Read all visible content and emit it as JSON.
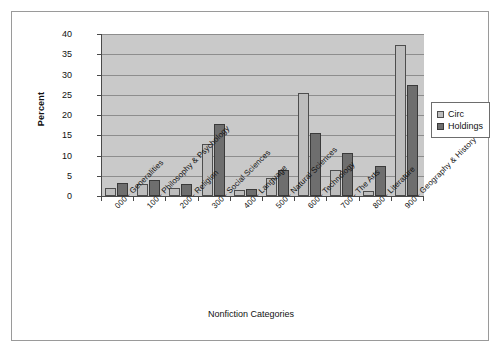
{
  "chart_data": {
    "type": "bar",
    "title": "",
    "xlabel": "Nonfiction Categories",
    "ylabel": "Percent",
    "ylim": [
      0,
      40
    ],
    "yticks": [
      0,
      5,
      10,
      15,
      20,
      25,
      30,
      35,
      40
    ],
    "grid": true,
    "legend_position": "right",
    "categories": [
      "000 - Generalities",
      "100 - Philosophy & Psychology",
      "200 - Religion",
      "300 - Social Sciences",
      "400 - Language",
      "500 - Natural Sciences",
      "600 - Technology",
      "700 - The Arts",
      "800 - Literature",
      "900 - Geography & History"
    ],
    "series": [
      {
        "name": "Circ",
        "color": "#bdbdbd",
        "values": [
          2.0,
          2.9,
          1.9,
          12.8,
          1.6,
          4.5,
          25.5,
          6.4,
          1.3,
          37.4
        ]
      },
      {
        "name": "Holdings",
        "color": "#6e6e6e",
        "values": [
          3.1,
          4.0,
          2.9,
          17.8,
          1.7,
          6.5,
          15.5,
          10.5,
          7.3,
          27.3
        ]
      }
    ]
  },
  "legend": {
    "items": [
      {
        "label": "Circ"
      },
      {
        "label": "Holdings"
      }
    ]
  },
  "colors": {
    "plot_background": "#c9c9c9",
    "gridline": "#8d8d8d",
    "axis": "#4a4a4a",
    "frame": "#9a9a9a",
    "page_background": "#ffffff"
  }
}
